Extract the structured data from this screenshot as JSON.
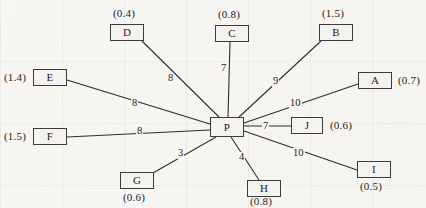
{
  "diagram": {
    "center_node": {
      "id": "P",
      "label": "P",
      "x": 210,
      "y": 117,
      "w": 34,
      "h": 20
    },
    "nodes": [
      {
        "id": "A",
        "label": "A",
        "capacity": "(0.7)",
        "x": 358,
        "y": 72,
        "w": 34,
        "h": 17,
        "cap_x": 398,
        "cap_y": 75,
        "cap_align": "left"
      },
      {
        "id": "B",
        "label": "B",
        "capacity": "(1.5)",
        "x": 319,
        "y": 24,
        "w": 34,
        "h": 17,
        "cap_x": 322,
        "cap_y": 8,
        "cap_align": "left"
      },
      {
        "id": "C",
        "label": "C",
        "capacity": "(0.8)",
        "x": 215,
        "y": 25,
        "w": 34,
        "h": 17,
        "cap_x": 218,
        "cap_y": 9,
        "cap_align": "left"
      },
      {
        "id": "D",
        "label": "D",
        "capacity": "(0.4)",
        "x": 110,
        "y": 24,
        "w": 34,
        "h": 17,
        "cap_x": 113,
        "cap_y": 8,
        "cap_align": "left"
      },
      {
        "id": "E",
        "label": "E",
        "capacity": "(1.4)",
        "x": 33,
        "y": 69,
        "w": 34,
        "h": 17,
        "cap_x": 4,
        "cap_y": 72,
        "cap_align": "left"
      },
      {
        "id": "F",
        "label": "F",
        "capacity": "(1.5)",
        "x": 33,
        "y": 128,
        "w": 34,
        "h": 17,
        "cap_x": 4,
        "cap_y": 131,
        "cap_align": "left"
      },
      {
        "id": "G",
        "label": "G",
        "capacity": "(0.6)",
        "x": 120,
        "y": 172,
        "w": 34,
        "h": 17,
        "cap_x": 123,
        "cap_y": 192,
        "cap_align": "left"
      },
      {
        "id": "H",
        "label": "H",
        "capacity": "(0.8)",
        "x": 247,
        "y": 180,
        "w": 34,
        "h": 17,
        "cap_x": 250,
        "cap_y": 196,
        "cap_align": "left"
      },
      {
        "id": "I",
        "label": "I",
        "capacity": "(0.5)",
        "x": 357,
        "y": 161,
        "w": 34,
        "h": 17,
        "cap_x": 360,
        "cap_y": 181,
        "cap_align": "left"
      },
      {
        "id": "J",
        "label": "J",
        "capacity": "(0.6)",
        "x": 291,
        "y": 117,
        "w": 32,
        "h": 17,
        "cap_x": 330,
        "cap_y": 120,
        "cap_align": "left"
      }
    ],
    "edges": [
      {
        "from": "P",
        "to": "A",
        "weight": "10",
        "x1": 244,
        "y1": 123,
        "x2": 358,
        "y2": 84,
        "wx": 289,
        "wy": 98
      },
      {
        "from": "P",
        "to": "B",
        "weight": "9",
        "x1": 238,
        "y1": 118,
        "x2": 321,
        "y2": 41,
        "wx": 272,
        "wy": 76
      },
      {
        "from": "P",
        "to": "C",
        "weight": "7",
        "x1": 228,
        "y1": 117,
        "x2": 230,
        "y2": 42,
        "wx": 220,
        "wy": 63
      },
      {
        "from": "P",
        "to": "D",
        "weight": "8",
        "x1": 219,
        "y1": 117,
        "x2": 142,
        "y2": 41,
        "wx": 167,
        "wy": 73
      },
      {
        "from": "P",
        "to": "E",
        "weight": "8",
        "x1": 210,
        "y1": 124,
        "x2": 67,
        "y2": 80,
        "wx": 131,
        "wy": 98
      },
      {
        "from": "P",
        "to": "F",
        "weight": "8",
        "x1": 210,
        "y1": 130,
        "x2": 67,
        "y2": 137,
        "wx": 136,
        "wy": 126
      },
      {
        "from": "P",
        "to": "G",
        "weight": "3",
        "x1": 216,
        "y1": 137,
        "x2": 153,
        "y2": 173,
        "wx": 177,
        "wy": 148
      },
      {
        "from": "P",
        "to": "H",
        "weight": "4",
        "x1": 231,
        "y1": 137,
        "x2": 259,
        "y2": 180,
        "wx": 238,
        "wy": 152
      },
      {
        "from": "P",
        "to": "I",
        "weight": "10",
        "x1": 244,
        "y1": 131,
        "x2": 357,
        "y2": 170,
        "wx": 292,
        "wy": 148
      },
      {
        "from": "P",
        "to": "J",
        "weight": "7",
        "x1": 244,
        "y1": 126,
        "x2": 291,
        "y2": 126,
        "wx": 262,
        "wy": 121
      }
    ]
  }
}
